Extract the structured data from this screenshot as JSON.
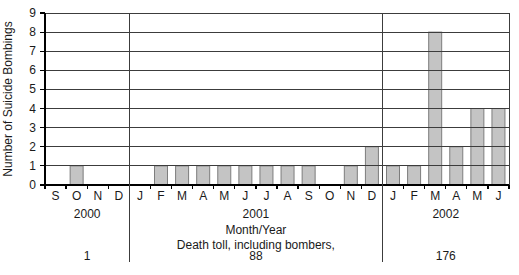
{
  "chart_data": {
    "type": "bar",
    "title": "",
    "ylabel": "Number of Suicide Bombings",
    "xlabel": "Month/Year",
    "footnote": "Death toll, including bombers,",
    "ylim": [
      0,
      9
    ],
    "yticks": [
      0,
      1,
      2,
      3,
      4,
      5,
      6,
      7,
      8,
      9
    ],
    "grid": true,
    "legend": "none",
    "bar_color": "#c4c4c4",
    "bar_border_color": "#7d7d7d",
    "grid_color": "#3c3c3c",
    "axis_color": "#000000",
    "groups": [
      {
        "year": "2000",
        "death_toll": "1",
        "months": [
          "S",
          "O",
          "N",
          "D"
        ],
        "values": [
          0,
          1,
          0,
          0
        ]
      },
      {
        "year": "2001",
        "death_toll": "88",
        "months": [
          "J",
          "F",
          "M",
          "A",
          "M",
          "J",
          "J",
          "A",
          "S",
          "O",
          "N",
          "D"
        ],
        "values": [
          0,
          1,
          1,
          1,
          1,
          1,
          1,
          1,
          1,
          0,
          1,
          2
        ]
      },
      {
        "year": "2002",
        "death_toll": "176",
        "months": [
          "J",
          "F",
          "M",
          "A",
          "M",
          "J"
        ],
        "values": [
          1,
          1,
          8,
          2,
          4,
          4
        ]
      }
    ]
  }
}
